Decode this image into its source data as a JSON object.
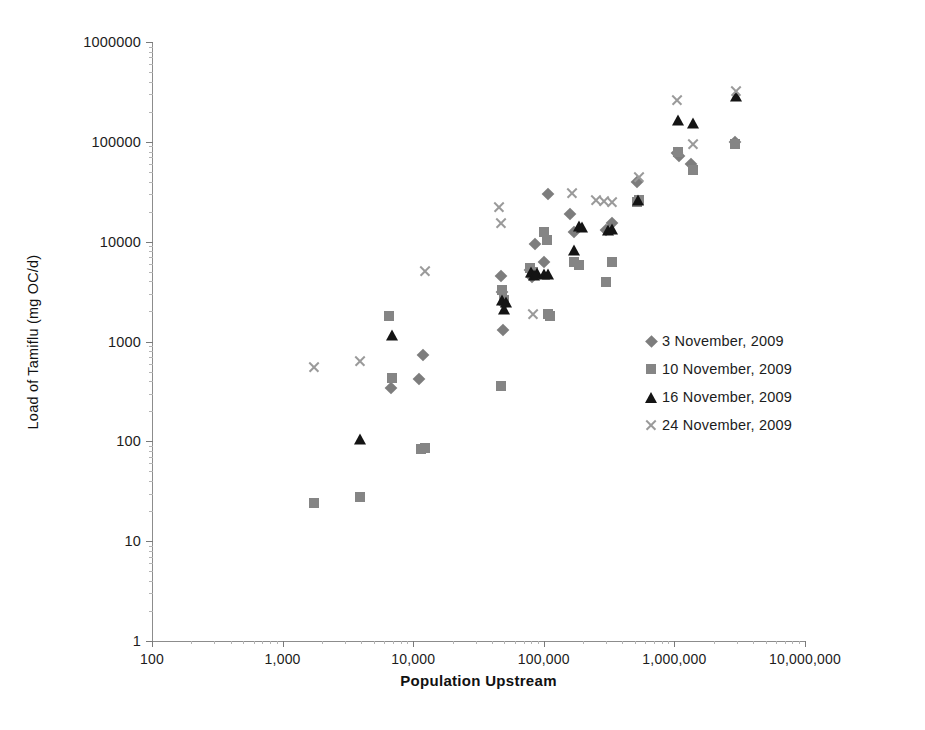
{
  "chart_data": {
    "type": "scatter",
    "title": "",
    "xlabel": "Population Upstream",
    "ylabel": "Load of Tamiflu (mg OC/d)",
    "xscale": "log",
    "yscale": "log",
    "xlim": [
      100,
      10000000
    ],
    "ylim": [
      1,
      1000000
    ],
    "grid": false,
    "legend_position": "right-middle",
    "xticks": [
      "100",
      "1,000",
      "10,000",
      "100,000",
      "1,000,000",
      "10,000,000"
    ],
    "xtick_values": [
      100,
      1000,
      10000,
      100000,
      1000000,
      10000000
    ],
    "yticks": [
      "1",
      "10",
      "100",
      "1000",
      "10000",
      "100000",
      "1000000"
    ],
    "ytick_values": [
      1,
      10,
      100,
      1000,
      10000,
      100000,
      1000000
    ],
    "marker_colors": {
      "diamond": "#7d7d7d",
      "square": "#858585",
      "triangle": "#141414",
      "cross": "#9a9a9a"
    },
    "series": [
      {
        "name": "3 November, 2009",
        "marker": "diamond",
        "points": [
          [
            6800,
            340
          ],
          [
            11800,
            730
          ],
          [
            11000,
            420
          ],
          [
            47000,
            4500
          ],
          [
            48000,
            3100
          ],
          [
            50000,
            2400
          ],
          [
            49000,
            1300
          ],
          [
            78000,
            5200
          ],
          [
            81000,
            4400
          ],
          [
            86000,
            9500
          ],
          [
            100000,
            6300
          ],
          [
            108000,
            30000
          ],
          [
            160000,
            19000
          ],
          [
            170000,
            12500
          ],
          [
            300000,
            13000
          ],
          [
            330000,
            15500
          ],
          [
            520000,
            40000
          ],
          [
            1050000,
            78000
          ],
          [
            1080000,
            72000
          ],
          [
            1350000,
            60000
          ],
          [
            2900000,
            100000
          ]
        ]
      },
      {
        "name": "10 November, 2009",
        "marker": "square",
        "points": [
          [
            1750,
            24
          ],
          [
            3900,
            28
          ],
          [
            6500,
            1800
          ],
          [
            6900,
            430
          ],
          [
            11500,
            83
          ],
          [
            12300,
            85
          ],
          [
            47000,
            360
          ],
          [
            48000,
            3300
          ],
          [
            50000,
            2600
          ],
          [
            79000,
            5400
          ],
          [
            83000,
            5000
          ],
          [
            100000,
            12500
          ],
          [
            105000,
            10500
          ],
          [
            108000,
            1900
          ],
          [
            112000,
            1800
          ],
          [
            170000,
            6200
          ],
          [
            185000,
            5800
          ],
          [
            300000,
            3900
          ],
          [
            330000,
            6200
          ],
          [
            520000,
            25000
          ],
          [
            540000,
            26000
          ],
          [
            1060000,
            80000
          ],
          [
            1400000,
            52000
          ],
          [
            2900000,
            95000
          ]
        ]
      },
      {
        "name": "16 November, 2009",
        "marker": "triangle",
        "points": [
          [
            3900,
            105
          ],
          [
            6900,
            1150
          ],
          [
            48000,
            2600
          ],
          [
            50000,
            2100
          ],
          [
            51000,
            2500
          ],
          [
            80000,
            5000
          ],
          [
            84000,
            4600
          ],
          [
            88000,
            4800
          ],
          [
            100000,
            4700
          ],
          [
            108000,
            4700
          ],
          [
            170000,
            8200
          ],
          [
            185000,
            14500
          ],
          [
            195000,
            14000
          ],
          [
            310000,
            13000
          ],
          [
            330000,
            13500
          ],
          [
            530000,
            26000
          ],
          [
            1060000,
            165000
          ],
          [
            1400000,
            155000
          ],
          [
            2950000,
            290000
          ]
        ]
      },
      {
        "name": "24 November, 2009",
        "marker": "cross",
        "points": [
          [
            1750,
            560
          ],
          [
            3900,
            640
          ],
          [
            12300,
            5100
          ],
          [
            45000,
            22000
          ],
          [
            47000,
            15500
          ],
          [
            82000,
            1900
          ],
          [
            165000,
            31000
          ],
          [
            250000,
            26000
          ],
          [
            290000,
            25500
          ],
          [
            330000,
            25000
          ],
          [
            540000,
            44000
          ],
          [
            1050000,
            260000
          ],
          [
            1400000,
            96000
          ],
          [
            2950000,
            320000
          ]
        ]
      }
    ]
  },
  "legend": {
    "items": [
      {
        "label": "3 November, 2009",
        "marker": "diamond"
      },
      {
        "label": "10 November, 2009",
        "marker": "square"
      },
      {
        "label": "16 November, 2009",
        "marker": "triangle"
      },
      {
        "label": "24 November, 2009",
        "marker": "cross"
      }
    ]
  }
}
